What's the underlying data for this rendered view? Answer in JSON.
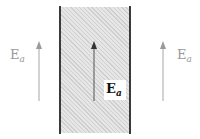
{
  "diagram": {
    "colors": {
      "wall": "#3a3a3a",
      "slab_fill": "#e6e6e6",
      "hatch": "#cfcfcf",
      "outer_arrow": "#b5b5b5",
      "inner_arrow": "#555555",
      "outer_label": "#9a9a9a",
      "inner_label": "#111111"
    },
    "labels": {
      "left": {
        "symbol": "E",
        "subscript": "a"
      },
      "center": {
        "symbol": "E",
        "subscript": "a"
      },
      "right": {
        "symbol": "E",
        "subscript": "a"
      }
    },
    "arrows": [
      {
        "id": "left",
        "x": 39,
        "y_tail": 101,
        "y_head": 42,
        "direction": "up"
      },
      {
        "id": "center",
        "x": 94,
        "y_tail": 101,
        "y_head": 42,
        "direction": "up"
      },
      {
        "id": "right",
        "x": 163,
        "y_tail": 101,
        "y_head": 42,
        "direction": "up"
      }
    ]
  }
}
